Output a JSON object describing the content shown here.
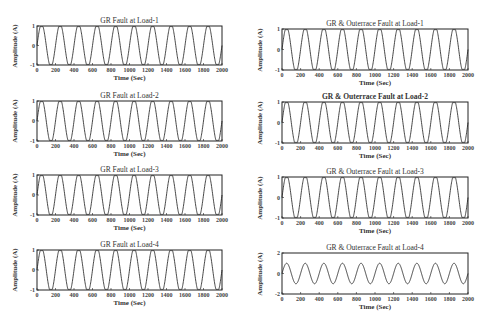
{
  "chart_data": [
    {
      "type": "line",
      "title": "GR Fault at Load-1",
      "xlabel": "Time (Sec)",
      "ylabel": "Amplitude (A)",
      "xlim": [
        0,
        2000
      ],
      "ylim": [
        -1,
        1
      ],
      "xticks": [
        0,
        200,
        400,
        600,
        800,
        1000,
        1200,
        1400,
        1600,
        1800,
        2000
      ],
      "yticks": [
        -1,
        0,
        1
      ],
      "series": [
        {
          "name": "current",
          "period": 200,
          "amplitude": 1.1,
          "clip": 1,
          "phase_deg": 0
        }
      ],
      "grid": false,
      "title_bold": false
    },
    {
      "type": "line",
      "title": "GR & Outerrace Fault at Load-1",
      "xlabel": "Time (Sec)",
      "ylabel": "Amplitude (A)",
      "xlim": [
        0,
        2000
      ],
      "ylim": [
        -1,
        1
      ],
      "xticks": [
        0,
        200,
        400,
        600,
        800,
        1000,
        1200,
        1400,
        1600,
        1800,
        2000
      ],
      "yticks": [
        -1,
        0,
        1
      ],
      "series": [
        {
          "name": "current",
          "period": 200,
          "amplitude": 1.1,
          "clip": 1,
          "phase_deg": 0
        }
      ],
      "grid": false,
      "title_bold": false
    },
    {
      "type": "line",
      "title": "GR Fault at Load-2",
      "xlabel": "Time (Sec)",
      "ylabel": "Amplitude (A)",
      "xlim": [
        0,
        2000
      ],
      "ylim": [
        -1,
        1
      ],
      "xticks": [
        0,
        200,
        400,
        600,
        800,
        1000,
        1200,
        1400,
        1600,
        1800,
        2000
      ],
      "yticks": [
        -1,
        0,
        1
      ],
      "series": [
        {
          "name": "current",
          "period": 200,
          "amplitude": 1.1,
          "clip": 1,
          "phase_deg": 0
        }
      ],
      "grid": false,
      "title_bold": false
    },
    {
      "type": "line",
      "title": "GR & Outerrace Fault at Load-2",
      "xlabel": "Time (Sec)",
      "ylabel": "Amplitude (A)",
      "xlim": [
        0,
        2000
      ],
      "ylim": [
        -1,
        1
      ],
      "xticks": [
        0,
        200,
        400,
        600,
        800,
        1000,
        1200,
        1400,
        1600,
        1800,
        2000
      ],
      "yticks": [
        -1,
        0,
        1
      ],
      "series": [
        {
          "name": "current",
          "period": 200,
          "amplitude": 1.1,
          "clip": 1,
          "phase_deg": 0
        }
      ],
      "grid": false,
      "title_bold": true
    },
    {
      "type": "line",
      "title": "GR Fault at Load-3",
      "xlabel": "Time (Sec)",
      "ylabel": "Amplitude (A)",
      "xlim": [
        0,
        2000
      ],
      "ylim": [
        -1,
        1
      ],
      "xticks": [
        0,
        200,
        400,
        600,
        800,
        1000,
        1200,
        1400,
        1600,
        1800,
        2000
      ],
      "yticks": [
        -1,
        0,
        1
      ],
      "series": [
        {
          "name": "current",
          "period": 200,
          "amplitude": 1.1,
          "clip": 1,
          "phase_deg": 0
        }
      ],
      "grid": false,
      "title_bold": false
    },
    {
      "type": "line",
      "title": "GR & Outerrace Fault at Load-3",
      "xlabel": "Time (Sec)",
      "ylabel": "Amplitude (A)",
      "xlim": [
        0,
        2000
      ],
      "ylim": [
        -1,
        1
      ],
      "xticks": [
        0,
        200,
        400,
        600,
        800,
        1000,
        1200,
        1400,
        1600,
        1800,
        2000
      ],
      "yticks": [
        -1,
        0,
        1
      ],
      "series": [
        {
          "name": "current",
          "period": 200,
          "amplitude": 1.1,
          "clip": 1,
          "phase_deg": 0
        }
      ],
      "grid": false,
      "title_bold": false
    },
    {
      "type": "line",
      "title": "GR Fault at Load-4",
      "xlabel": "Time (Sec)",
      "ylabel": "Amplitude (A)",
      "xlim": [
        0,
        2000
      ],
      "ylim": [
        -1,
        1
      ],
      "xticks": [
        0,
        200,
        400,
        600,
        800,
        1000,
        1200,
        1400,
        1600,
        1800,
        2000
      ],
      "yticks": [
        -1,
        0,
        1
      ],
      "series": [
        {
          "name": "current",
          "period": 200,
          "amplitude": 1.1,
          "clip": 1,
          "phase_deg": 0
        }
      ],
      "grid": false,
      "title_bold": false
    },
    {
      "type": "line",
      "title": "GR & Outerrace Fault at Load-4",
      "xlabel": "Time (Sec)",
      "ylabel": "Amplitude (A)",
      "xlim": [
        0,
        2000
      ],
      "ylim": [
        -2,
        2
      ],
      "xticks": [
        0,
        200,
        400,
        600,
        800,
        1000,
        1200,
        1400,
        1600,
        1800,
        2000
      ],
      "yticks": [
        -2,
        0,
        2
      ],
      "series": [
        {
          "name": "current",
          "period": 200,
          "amplitude": 1.0,
          "clip": 2,
          "phase_deg": 0
        }
      ],
      "grid": false,
      "title_bold": false
    }
  ],
  "layout": [
    {
      "box": [
        37,
        26,
        185,
        39
      ]
    },
    {
      "box": [
        282,
        29,
        186,
        41
      ]
    },
    {
      "box": [
        37,
        101,
        185,
        40
      ]
    },
    {
      "box": [
        282,
        102,
        186,
        41
      ]
    },
    {
      "box": [
        37,
        175,
        185,
        40
      ]
    },
    {
      "box": [
        282,
        177,
        186,
        41
      ]
    },
    {
      "box": [
        37,
        250,
        185,
        40
      ]
    },
    {
      "box": [
        282,
        253,
        186,
        41
      ]
    }
  ],
  "colors": {
    "line": "#333333",
    "axes": "#222222"
  }
}
